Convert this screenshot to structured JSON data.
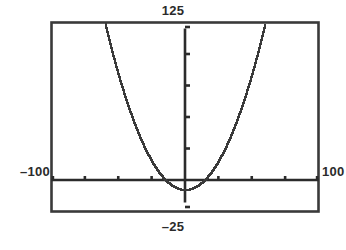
{
  "graph": {
    "labels": {
      "top": "125",
      "bottom": "–25",
      "left": "–100",
      "right": "100"
    },
    "colors": {
      "background": "#ffffff",
      "frame": "#3a3a3a",
      "axis": "#2b2b2b",
      "curve": "#3a3a3a",
      "text": "#2b2b2b"
    }
  },
  "chart_data": {
    "type": "line",
    "title": "",
    "subtitle": "",
    "xlabel": "",
    "ylabel": "",
    "xlim": [
      -100,
      100
    ],
    "ylim": [
      -25,
      125
    ],
    "grid": false,
    "legend": null,
    "annotations": [
      {
        "text": "125",
        "position": "top-center",
        "meaning": "y-axis maximum (Ymax)"
      },
      {
        "text": "–25",
        "position": "bottom-center",
        "meaning": "y-axis minimum (Ymin)"
      },
      {
        "text": "–100",
        "position": "left-middle",
        "meaning": "x-axis minimum (Xmin)"
      },
      {
        "text": "100",
        "position": "right-middle",
        "meaning": "x-axis maximum (Xmax)"
      }
    ],
    "axes": {
      "x_axis_y_value": 0,
      "y_axis_x_value": 0,
      "x_tick_spacing": 25,
      "y_tick_spacing": 25,
      "x_ticks": [
        -100,
        -75,
        -50,
        -25,
        0,
        25,
        50,
        75,
        100
      ],
      "y_ticks": [
        -25,
        0,
        25,
        50,
        75,
        100,
        125
      ]
    },
    "series": [
      {
        "name": "parabola",
        "shape": "upward parabola",
        "vertex": [
          0,
          -8
        ],
        "x_intercepts": [
          -10,
          10
        ],
        "x": [
          -60,
          -55,
          -50,
          -45,
          -40,
          -35,
          -30,
          -25,
          -20,
          -15,
          -10,
          -5,
          0,
          5,
          10,
          15,
          20,
          25,
          30,
          35,
          40,
          45,
          50,
          55,
          60
        ],
        "y": [
          124,
          104,
          86,
          69,
          54,
          41,
          30,
          20,
          13,
          6,
          2,
          -6,
          -8,
          -6,
          2,
          6,
          13,
          20,
          30,
          41,
          54,
          69,
          86,
          104,
          124
        ]
      }
    ]
  }
}
